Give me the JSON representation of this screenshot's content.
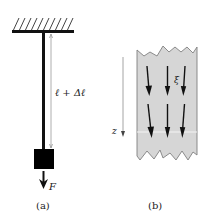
{
  "panels": [
    {
      "id": "a",
      "caption": "(a)",
      "length_label": "ℓ + Δℓ",
      "force_label": "F"
    },
    {
      "id": "b",
      "caption": "(b)",
      "axis_label": "z",
      "field_label": "ξ"
    }
  ],
  "colors": {
    "strip_fill": "#d6d6d6",
    "strip_edge": "#808080",
    "ink": "#111111",
    "dimension_line": "#9a9a9a"
  }
}
